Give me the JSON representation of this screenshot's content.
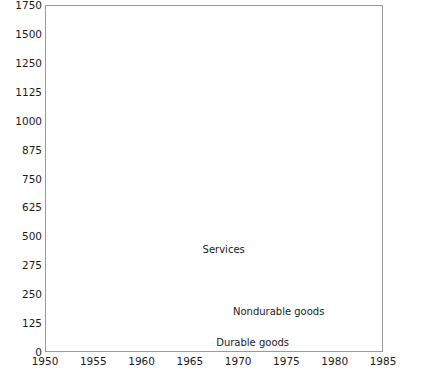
{
  "chart_data": {
    "type": "area",
    "stacked": true,
    "title": "",
    "subtitle": "",
    "xlabel": "",
    "ylabel": "",
    "grid": true,
    "legend_position": "inline-band-labels",
    "xlim": [
      1950,
      1985
    ],
    "ylim": [
      0,
      1750
    ],
    "x_ticks": [
      "1950",
      "1955",
      "1960",
      "1965",
      "1970",
      "1975",
      "1980",
      "1985"
    ],
    "x_tick_values": [
      1950,
      1955,
      1960,
      1965,
      1970,
      1975,
      1980,
      1985
    ],
    "y_ticks": [
      "0",
      "125",
      "250",
      "275",
      "500",
      "625",
      "750",
      "875",
      "1000",
      "1125",
      "1250",
      "1500",
      "1750"
    ],
    "y_tick_values": [
      0,
      125,
      250,
      275,
      500,
      625,
      750,
      875,
      1000,
      1125,
      1250,
      1500,
      1750
    ],
    "projection_start": 1980,
    "projection_note": "Values from 1980 to 1985 are drawn as dashed projections",
    "x": [
      1950,
      1951,
      1952,
      1953,
      1954,
      1955,
      1956,
      1957,
      1958,
      1959,
      1960,
      1961,
      1962,
      1963,
      1964,
      1965,
      1966,
      1967,
      1968,
      1969,
      1970,
      1971,
      1972,
      1973,
      1974,
      1975,
      1976,
      1977,
      1978,
      1979,
      1980,
      1985
    ],
    "series": [
      {
        "name": "Durable goods",
        "label": "Durable goods",
        "fill": "light-stipple",
        "values": [
          35,
          34,
          30,
          31,
          30,
          37,
          35,
          34,
          31,
          36,
          38,
          36,
          40,
          44,
          47,
          53,
          57,
          57,
          64,
          66,
          65,
          73,
          82,
          91,
          88,
          93,
          110,
          121,
          128,
          130,
          132,
          185
        ]
      },
      {
        "name": "Nondurable goods",
        "label": "Nondurable goods",
        "fill": "medium-stipple",
        "values": [
          128,
          132,
          134,
          134,
          134,
          143,
          148,
          153,
          156,
          165,
          170,
          172,
          180,
          188,
          200,
          215,
          232,
          240,
          258,
          275,
          292,
          300,
          320,
          355,
          400,
          440,
          480,
          530,
          580,
          620,
          655,
          790
        ]
      },
      {
        "name": "Services",
        "label": "Services",
        "fill": "fine-stipple",
        "values": [
          220,
          232,
          240,
          248,
          252,
          262,
          272,
          282,
          292,
          312,
          330,
          345,
          365,
          385,
          410,
          440,
          475,
          510,
          555,
          605,
          655,
          700,
          760,
          830,
          900,
          1000,
          1080,
          1150,
          1200,
          1240,
          1250,
          1700
        ]
      }
    ]
  },
  "axes": {
    "y_axis_name": "value-axis",
    "x_axis_name": "year-axis"
  }
}
